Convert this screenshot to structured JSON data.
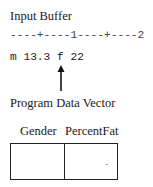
{
  "input_buffer": {
    "title": "Input Buffer",
    "ruler": "----+----1----+----2",
    "content": "m 13.3 f 22",
    "pointer_position_column": 8
  },
  "program_data_vector": {
    "title": "Program Data Vector",
    "columns": [
      {
        "name": "Gender",
        "value": ""
      },
      {
        "name": "PercentFat",
        "value": "."
      }
    ]
  },
  "icons": {
    "pointer": "up-arrow-icon"
  }
}
